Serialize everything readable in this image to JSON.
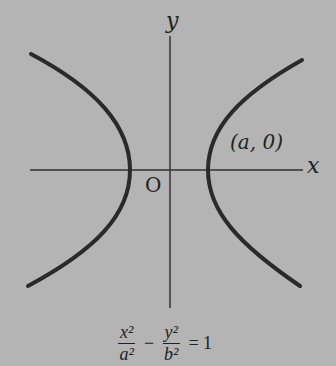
{
  "diagram": {
    "labels": {
      "y_axis": "y",
      "x_axis": "x",
      "origin": "O",
      "vertex": "(a, 0)"
    },
    "equation": {
      "term1_num": "x²",
      "term1_den": "a²",
      "operator": "−",
      "term2_num": "y²",
      "term2_den": "b²",
      "equals": "= 1"
    },
    "colors": {
      "background": "#b4b4b4",
      "curve": "#2a2a2a",
      "axis": "#333333"
    }
  }
}
